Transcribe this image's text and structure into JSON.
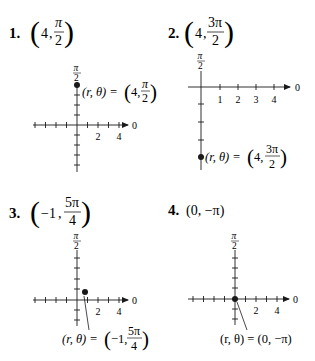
{
  "document": {
    "type": "exercise-set",
    "topic": "Plotting points in polar coordinates",
    "problems": [
      {
        "number": "1.",
        "point_r": "4",
        "point_theta_num": "π",
        "point_theta_den": "2",
        "axis_top_label_num": "π",
        "axis_top_label_den": "2",
        "axis_right_label": "0",
        "tick_labels": [
          "2",
          "4"
        ],
        "annotation_lhs": "(r, θ) =",
        "annotation_r": "4,",
        "annotation_theta_num": "π",
        "annotation_theta_den": "2"
      },
      {
        "number": "2.",
        "point_r": "4",
        "point_theta_num": "3π",
        "point_theta_den": "2",
        "axis_top_label_num": "π",
        "axis_top_label_den": "2",
        "axis_right_label": "0",
        "tick_labels": [
          "1",
          "2",
          "3",
          "4"
        ],
        "annotation_lhs": "(r, θ) =",
        "annotation_r": "4,",
        "annotation_theta_num": "3π",
        "annotation_theta_den": "2"
      },
      {
        "number": "3.",
        "point_r": "−1",
        "point_theta_num": "5π",
        "point_theta_den": "4",
        "axis_top_label_num": "π",
        "axis_top_label_den": "2",
        "axis_right_label": "0",
        "tick_labels": [
          "2",
          "4"
        ],
        "annotation_lhs": "(r, θ) =",
        "annotation_r": "−1,",
        "annotation_theta_num": "5π",
        "annotation_theta_den": "4"
      },
      {
        "number": "4.",
        "point_text": "(0, −π)",
        "axis_top_label_num": "π",
        "axis_top_label_den": "2",
        "axis_right_label": "0",
        "tick_labels": [
          "2",
          "4"
        ],
        "annotation_text": "(r, θ) = (0, −π)"
      }
    ]
  },
  "colors": {
    "ink": "#1a1a1a",
    "background": "#ffffff"
  }
}
